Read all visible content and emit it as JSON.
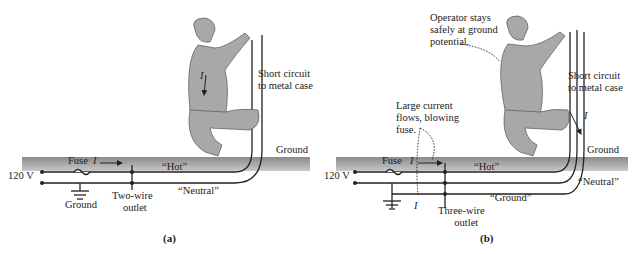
{
  "panels": [
    {
      "id": "a",
      "caption": "(a)",
      "labels": {
        "voltage": "120 V",
        "fuse": "Fuse",
        "current": "I",
        "hot": "“Hot”",
        "neutral": "“Neutral”",
        "ground_symbol": "Ground",
        "outlet": [
          "Two-wire",
          "outlet"
        ],
        "ground_surface": "Ground",
        "short_circuit": [
          "Short circuit",
          "to metal case"
        ],
        "body_current": "I"
      }
    },
    {
      "id": "b",
      "caption": "(b)",
      "labels": {
        "voltage": "120 V",
        "fuse": "Fuse",
        "current": "I",
        "hot": "“Hot”",
        "neutral": "“Neutral”",
        "ground_wire": "“Ground”",
        "outlet": [
          "Three-wire",
          "outlet"
        ],
        "ground_surface": "Ground",
        "short_circuit": [
          "Short circuit",
          "to metal case"
        ],
        "operator_note": [
          "Operator stays",
          "safely at ground",
          "potential."
        ],
        "large_current_note": [
          "Large current",
          "flows, blowing",
          "fuse."
        ],
        "wire_current": "I",
        "ground_current": "I"
      }
    }
  ],
  "colors": {
    "ground_band": "#9a9a9a",
    "figure_fill": "#a8a8a8",
    "wire": "#222222",
    "text": "#222222"
  }
}
